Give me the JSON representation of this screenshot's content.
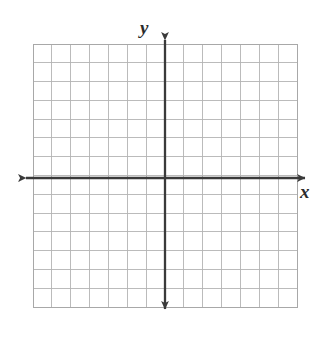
{
  "figure": {
    "background_color": "#ffffff",
    "width": 333,
    "height": 344
  },
  "labels": {
    "y_axis": "y",
    "x_axis": "x"
  },
  "colors": {
    "grid_line": "#b4b4b4",
    "grid_border": "#a8a8a8",
    "axis": "#3a3a3a",
    "label_text": "#2b2b2b",
    "background": "#ffffff"
  },
  "chart_data": {
    "type": "scatter",
    "title": "",
    "subtitle": "",
    "xlabel": "x",
    "ylabel": "y",
    "xlim": [
      -7,
      7
    ],
    "ylim": [
      -7,
      7
    ],
    "x_ticks": [
      -7,
      -6,
      -5,
      -4,
      -3,
      -2,
      -1,
      0,
      1,
      2,
      3,
      4,
      5,
      6,
      7
    ],
    "y_ticks": [
      -7,
      -6,
      -5,
      -4,
      -3,
      -2,
      -1,
      0,
      1,
      2,
      3,
      4,
      5,
      6,
      7
    ],
    "x_tick_labels": [],
    "y_tick_labels": [],
    "grid": true,
    "grid_columns": 14,
    "grid_rows": 14,
    "legend": null,
    "series": [],
    "annotations": [],
    "axes_arrows": {
      "x_left": true,
      "x_right": true,
      "y_top": true,
      "y_bottom": true
    },
    "origin_cell": {
      "column": 7,
      "row": 7
    }
  },
  "geometry": {
    "grid_left": 33,
    "grid_top": 44,
    "grid_right": 297,
    "grid_bottom": 307,
    "cell_width": 18.857,
    "cell_height": 18.786,
    "origin_x": 165,
    "origin_y": 178,
    "x_axis_start": 18,
    "x_axis_end": 313,
    "y_axis_start": 32,
    "y_axis_end": 317
  }
}
